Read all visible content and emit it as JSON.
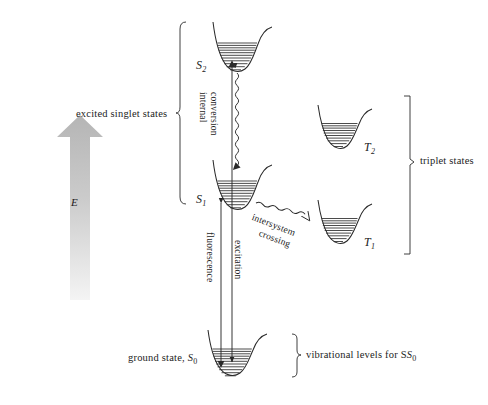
{
  "figure": {
    "type": "jablonski-energy-level-diagram",
    "background_color": "#ffffff",
    "line_color": "#1a1a1a",
    "arrow_fill_top": "#b9b9b9",
    "arrow_fill_bottom": "#f2f2f2"
  },
  "axis": {
    "energy_symbol": "E",
    "direction": "up"
  },
  "group_labels": {
    "excited_singlet": "excited singlet states",
    "triplet": "triplet states",
    "vibrational": "vibrational levels for S",
    "vibrational_sub": "0"
  },
  "states": [
    {
      "id": "S2",
      "symbol": "S",
      "sub": "2",
      "kind": "singlet",
      "levels": 11
    },
    {
      "id": "S1",
      "symbol": "S",
      "sub": "1",
      "kind": "singlet",
      "levels": 11
    },
    {
      "id": "T2",
      "symbol": "T",
      "sub": "2",
      "kind": "triplet",
      "levels": 10
    },
    {
      "id": "T1",
      "symbol": "T",
      "sub": "1",
      "kind": "triplet",
      "levels": 10
    },
    {
      "id": "S0",
      "symbol": "S",
      "sub": "0",
      "kind": "ground",
      "levels": 11
    }
  ],
  "ground_state": {
    "label": "ground state, ",
    "symbol": "S",
    "sub": "0"
  },
  "processes": [
    {
      "id": "internal-conversion",
      "line1": "internal",
      "line2": "conversion",
      "style": "wavy",
      "from": "S2",
      "to": "S1"
    },
    {
      "id": "intersystem-crossing",
      "line1": "intersystem",
      "line2": "crossing",
      "style": "wavy",
      "from": "S1",
      "to": "T1"
    },
    {
      "id": "fluorescence",
      "label": "fluorescence",
      "style": "straight",
      "from": "S1",
      "to": "S0"
    },
    {
      "id": "excitation",
      "label": "excitation",
      "style": "straight",
      "from": "S0",
      "to": "S2"
    }
  ]
}
